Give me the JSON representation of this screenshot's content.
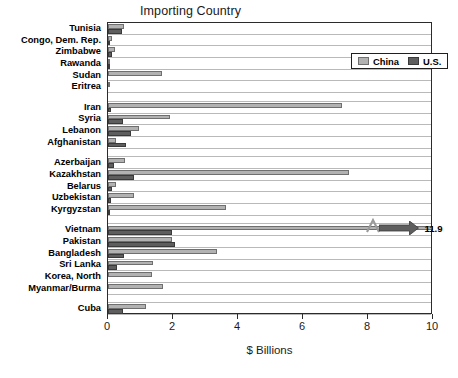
{
  "chart_data": {
    "type": "bar",
    "orientation": "horizontal",
    "title": "Importing Country",
    "xlabel": "$ Billions",
    "ylabel": "",
    "xlim": [
      0,
      10
    ],
    "xticks": [
      0,
      2,
      4,
      6,
      8,
      10
    ],
    "xticklabels": [
      "0",
      "2",
      "4",
      "6",
      "8",
      "10"
    ],
    "grid": true,
    "legend": {
      "position": "top-right-inside",
      "entries": [
        {
          "name": "China",
          "color": "#b2b2b2"
        },
        {
          "name": "U.S.",
          "color": "#5e5e5e"
        }
      ]
    },
    "series": [
      {
        "name": "China",
        "color": "#b2b2b2"
      },
      {
        "name": "U.S.",
        "color": "#5e5e5e"
      }
    ],
    "groups": [
      {
        "name": "Africa",
        "rows": [
          {
            "label": "Tunisia",
            "china": 0.5,
            "us": 0.42
          },
          {
            "label": "Congo, Dem. Rep.",
            "china": 0.13,
            "us": 0.06
          },
          {
            "label": "Zimbabwe",
            "china": 0.21,
            "us": 0.12
          },
          {
            "label": "Rawanda",
            "china": 0.04,
            "us": 0.02
          },
          {
            "label": "Sudan",
            "china": 1.65,
            "us": 0.0
          },
          {
            "label": "Eritrea",
            "china": 0.06,
            "us": 0.01
          }
        ]
      },
      {
        "name": "Middle East",
        "rows": [
          {
            "label": "Iran",
            "china": 7.2,
            "us": 0.1
          },
          {
            "label": "Syria",
            "china": 1.9,
            "us": 0.45
          },
          {
            "label": "Lebanon",
            "china": 0.95,
            "us": 0.72
          },
          {
            "label": "Afghanistan",
            "china": 0.25,
            "us": 0.55
          }
        ]
      },
      {
        "name": "Central Asia",
        "rows": [
          {
            "label": "Azerbaijan",
            "china": 0.52,
            "us": 0.17
          },
          {
            "label": "Kazakhstan",
            "china": 7.4,
            "us": 0.8
          },
          {
            "label": "Belarus",
            "china": 0.25,
            "us": 0.12
          },
          {
            "label": "Uzbekistan",
            "china": 0.8,
            "us": 0.1
          },
          {
            "label": "Kyrgyzstan",
            "china": 3.62,
            "us": 0.04
          }
        ]
      },
      {
        "name": "Asia",
        "rows": [
          {
            "label": "Vietnam",
            "china": 11.9,
            "us": 1.98,
            "china_truncated": true,
            "china_display_value": "11.9"
          },
          {
            "label": "Pakistan",
            "china": 1.98,
            "us": 2.05
          },
          {
            "label": "Bangladesh",
            "china": 3.35,
            "us": 0.5
          },
          {
            "label": "Sri Lanka",
            "china": 1.38,
            "us": 0.28
          },
          {
            "label": "Korea, North",
            "china": 1.35,
            "us": 0.0
          },
          {
            "label": "Myanmar/Burma",
            "china": 1.7,
            "us": 0.0
          }
        ]
      },
      {
        "name": "Americas",
        "rows": [
          {
            "label": "Cuba",
            "china": 1.18,
            "us": 0.45
          }
        ]
      }
    ],
    "annotations": [
      {
        "name": "vietnam-overflow",
        "text": "11.9",
        "type": "axis-break-arrow",
        "attached_to": "Vietnam"
      }
    ]
  }
}
